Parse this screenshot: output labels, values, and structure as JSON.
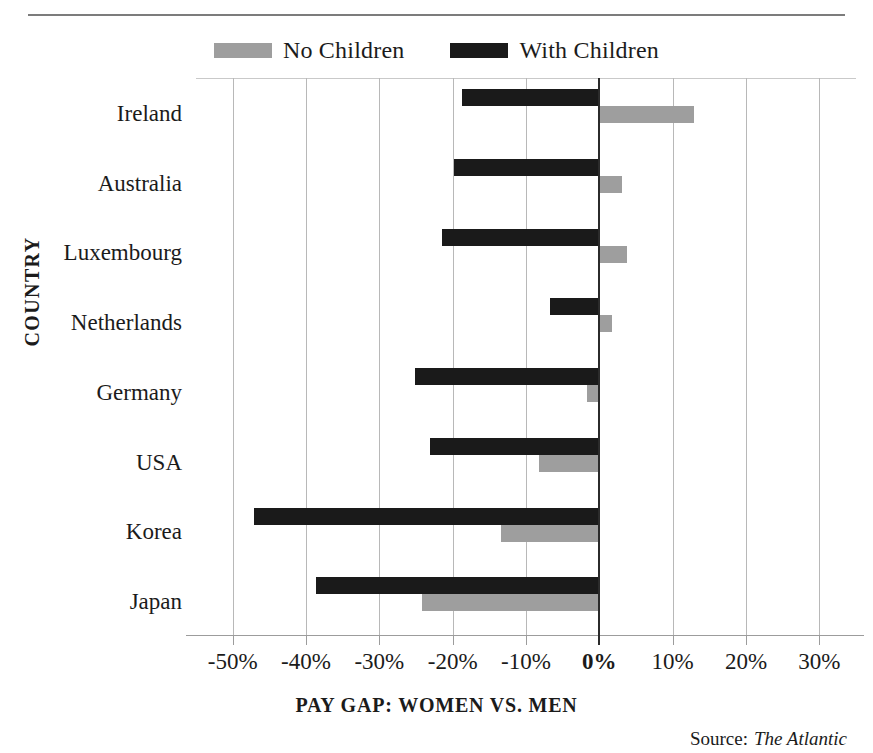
{
  "legend": {
    "items": [
      {
        "label": "No Children",
        "color": "#9e9e9e",
        "swatch_name": "legend-swatch-no-children"
      },
      {
        "label": "With Children",
        "color": "#1a1a1a",
        "swatch_name": "legend-swatch-with-children"
      }
    ]
  },
  "axes": {
    "y_title": "COUNTRY",
    "x_title": "PAY GAP: WOMEN VS. MEN",
    "x_ticks": [
      "-50%",
      "-40%",
      "-30%",
      "-20%",
      "-10%",
      "0%",
      "10%",
      "20%",
      "30%"
    ]
  },
  "source": {
    "label": "Source:",
    "name": "The Atlantic"
  },
  "chart_data": {
    "type": "bar",
    "orientation": "horizontal",
    "title": "",
    "xlabel": "PAY GAP: WOMEN VS. MEN",
    "ylabel": "COUNTRY",
    "xlim": [
      -55,
      35
    ],
    "xticks": [
      -50,
      -40,
      -30,
      -20,
      -10,
      0,
      10,
      20,
      30
    ],
    "xtick_labels": [
      "-50%",
      "-40%",
      "-30%",
      "-20%",
      "-10%",
      "0%",
      "10%",
      "20%",
      "30%"
    ],
    "grid": true,
    "legend_position": "top-center",
    "units": "percent",
    "categories": [
      "Ireland",
      "Australia",
      "Luxembourg",
      "Netherlands",
      "Germany",
      "USA",
      "Korea",
      "Japan"
    ],
    "series": [
      {
        "name": "No Children",
        "color": "#9e9e9e",
        "values": [
          12.9,
          3.1,
          3.8,
          1.7,
          -1.7,
          -8.2,
          -13.4,
          -24.2
        ]
      },
      {
        "name": "With Children",
        "color": "#1a1a1a",
        "values": [
          -18.7,
          -19.8,
          -21.5,
          -6.7,
          -25.2,
          -23.1,
          -47.1,
          -38.6
        ]
      }
    ]
  }
}
